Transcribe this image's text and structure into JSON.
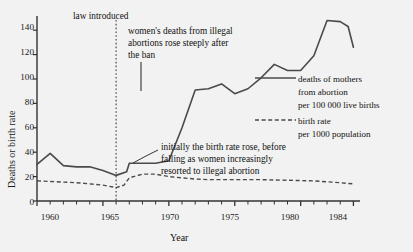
{
  "chart_data": {
    "type": "line",
    "title": "",
    "xlabel": "Year",
    "ylabel": "Deaths or birth rate",
    "xlim": [
      1960,
      1984.5
    ],
    "ylim": [
      0,
      150
    ],
    "yticks": [
      0,
      20,
      40,
      60,
      80,
      100,
      120,
      140
    ],
    "ytick_labels": [
      "0",
      "20",
      "40",
      "60",
      "80",
      "100",
      "120",
      "140"
    ],
    "xticks": [
      1960,
      1965,
      1970,
      1975,
      1980,
      1984
    ],
    "xtick_labels": [
      "1960",
      "1965",
      "1970",
      "1975",
      "1980",
      "1984"
    ],
    "minor_xticks_every": 1,
    "grid": false,
    "legend_position": "right-middle",
    "x": [
      1960,
      1961,
      1962,
      1963,
      1964,
      1965,
      1966,
      1967,
      1968,
      1969,
      1970,
      1971,
      1972,
      1973,
      1974,
      1975,
      1976,
      1977,
      1978,
      1979,
      1980,
      1981,
      1982,
      1983,
      1984
    ],
    "series": [
      {
        "name": "deaths of mothers from abortion per 100 000 live births",
        "style": "solid",
        "color": "#4a4a4a",
        "values": [
          30,
          39,
          29,
          28,
          28,
          25,
          21,
          25,
          31,
          31,
          31,
          33,
          46,
          60,
          74,
          91,
          94,
          96,
          88,
          92,
          101,
          112,
          107,
          107,
          119
        ]
      },
      {
        "name": "birth rate per 1000 population",
        "style": "dashed",
        "color": "#4a4a4a",
        "values": [
          16.5,
          16,
          15.5,
          15,
          14.5,
          14,
          13,
          11,
          17,
          22,
          22,
          21,
          20,
          19,
          18,
          17.5,
          17.5,
          17.5,
          17,
          17,
          17,
          16.5,
          16,
          15.5,
          15
        ]
      }
    ],
    "series_note": "values listed per year 1960-1984; solid series continues to peak 148 in 1982 and falls to 126 in 1984",
    "solid_points": [
      {
        "year": 1960,
        "value": 30
      },
      {
        "year": 1961,
        "value": 39
      },
      {
        "year": 1962,
        "value": 29
      },
      {
        "year": 1963,
        "value": 28
      },
      {
        "year": 1964,
        "value": 28
      },
      {
        "year": 1965,
        "value": 25
      },
      {
        "year": 1966,
        "value": 21
      },
      {
        "year": 1966.8,
        "value": 24
      },
      {
        "year": 1967,
        "value": 31
      },
      {
        "year": 1968,
        "value": 31
      },
      {
        "year": 1969,
        "value": 31
      },
      {
        "year": 1970,
        "value": 33
      },
      {
        "year": 1971,
        "value": 60
      },
      {
        "year": 1972,
        "value": 91
      },
      {
        "year": 1973,
        "value": 92
      },
      {
        "year": 1974,
        "value": 96
      },
      {
        "year": 1975,
        "value": 88
      },
      {
        "year": 1976,
        "value": 92
      },
      {
        "year": 1977,
        "value": 101
      },
      {
        "year": 1978,
        "value": 112
      },
      {
        "year": 1979,
        "value": 107
      },
      {
        "year": 1980,
        "value": 107
      },
      {
        "year": 1981,
        "value": 119
      },
      {
        "year": 1982,
        "value": 148
      },
      {
        "year": 1983,
        "value": 147
      },
      {
        "year": 1983.6,
        "value": 143
      },
      {
        "year": 1984,
        "value": 126
      }
    ],
    "dashed_points": [
      {
        "year": 1960,
        "value": 16.5
      },
      {
        "year": 1961,
        "value": 16
      },
      {
        "year": 1962,
        "value": 15.5
      },
      {
        "year": 1963,
        "value": 15
      },
      {
        "year": 1964,
        "value": 14
      },
      {
        "year": 1965,
        "value": 13
      },
      {
        "year": 1966,
        "value": 11
      },
      {
        "year": 1966.6,
        "value": 13
      },
      {
        "year": 1967,
        "value": 19
      },
      {
        "year": 1968,
        "value": 22
      },
      {
        "year": 1969,
        "value": 22
      },
      {
        "year": 1970,
        "value": 20
      },
      {
        "year": 1971,
        "value": 19
      },
      {
        "year": 1972,
        "value": 18
      },
      {
        "year": 1973,
        "value": 17.5
      },
      {
        "year": 1975,
        "value": 17.5
      },
      {
        "year": 1977,
        "value": 17.5
      },
      {
        "year": 1979,
        "value": 17
      },
      {
        "year": 1981,
        "value": 16.5
      },
      {
        "year": 1983,
        "value": 15
      },
      {
        "year": 1984,
        "value": 14
      }
    ],
    "event_marker": {
      "year": 1966,
      "label": "law introduced",
      "style": "dotted-vertical"
    },
    "annotations": [
      {
        "id": "law-introduced",
        "lines": [
          "law introduced"
        ]
      },
      {
        "id": "deaths-rose",
        "lines": [
          "women's deaths from illegal",
          "abortions rose steeply after",
          "the ban"
        ]
      },
      {
        "id": "birth-rate-rose",
        "lines": [
          "initially the birth rate rose, before",
          "falling as women increasingly",
          "resorted to illegal abortion"
        ]
      }
    ],
    "legend": [
      {
        "style": "solid",
        "lines": [
          "deaths of mothers",
          "from abortion",
          "per 100 000 live births"
        ]
      },
      {
        "style": "dashed",
        "lines": [
          "birth rate",
          "per 1000 population"
        ]
      }
    ]
  },
  "axes": {
    "ylabel": "Deaths or birth rate",
    "xlabel": "Year",
    "ytick_labels": [
      "140",
      "120",
      "100",
      "80",
      "60",
      "40",
      "20",
      "0"
    ],
    "xtick_labels": [
      "1960",
      "1965",
      "1970",
      "1975",
      "1980",
      "1984"
    ]
  },
  "annotations": {
    "law_introduced": "law introduced",
    "deaths_l1": "women's deaths from illegal",
    "deaths_l2": "abortions rose steeply after",
    "deaths_l3": "the ban",
    "birth_l1": "initially the birth rate rose, before",
    "birth_l2": "falling as women increasingly",
    "birth_l3": "resorted to illegal abortion"
  },
  "legend": {
    "solid_l1": "deaths of mothers",
    "solid_l2": "from abortion",
    "solid_l3": "per 100 000 live births",
    "dashed_l1": "birth rate",
    "dashed_l2": "per 1000 population"
  },
  "colors": {
    "background": "#f2f2f2",
    "line": "#4a4a4a",
    "axis": "#333333",
    "text": "#111111"
  }
}
